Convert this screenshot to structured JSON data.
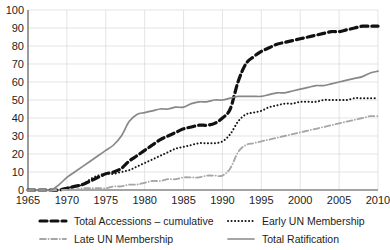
{
  "chart_data": {
    "type": "line",
    "title": "",
    "subtitle": "",
    "xlabel": "",
    "ylabel": "",
    "xlim": [
      1965,
      2010
    ],
    "ylim": [
      0,
      100
    ],
    "xticks": [
      1965,
      1970,
      1975,
      1980,
      1985,
      1990,
      1995,
      2000,
      2005,
      2010
    ],
    "yticks": [
      0,
      10,
      20,
      30,
      40,
      50,
      60,
      70,
      80,
      90,
      100
    ],
    "grid": true,
    "legend_position": "bottom",
    "x": [
      1965,
      1966,
      1967,
      1968,
      1969,
      1970,
      1971,
      1972,
      1973,
      1974,
      1975,
      1976,
      1977,
      1978,
      1979,
      1980,
      1981,
      1982,
      1983,
      1984,
      1985,
      1986,
      1987,
      1988,
      1989,
      1990,
      1991,
      1992,
      1993,
      1994,
      1995,
      1996,
      1997,
      1998,
      1999,
      2000,
      2001,
      2002,
      2003,
      2004,
      2005,
      2006,
      2007,
      2008,
      2009,
      2010
    ],
    "series": [
      {
        "name": "Total Accessions – cumulative",
        "color": "#111111",
        "style": "dashed",
        "width": 3.2,
        "values": [
          0,
          0,
          0,
          0,
          0,
          1,
          2,
          3,
          5,
          7,
          9,
          10,
          12,
          16,
          19,
          22,
          25,
          28,
          30,
          32,
          34,
          35,
          36,
          36,
          37,
          40,
          45,
          60,
          70,
          74,
          77,
          79,
          81,
          82,
          83,
          84,
          85,
          86,
          87,
          88,
          88,
          89,
          90,
          91,
          91,
          91
        ]
      },
      {
        "name": "Early UN Membership",
        "color": "#141414",
        "style": "dotted",
        "width": 2.0,
        "values": [
          0,
          0,
          0,
          0,
          0,
          1,
          2,
          3,
          6,
          8,
          9,
          9,
          10,
          11,
          13,
          15,
          17,
          19,
          21,
          23,
          24,
          25,
          26,
          26,
          26,
          27,
          31,
          38,
          42,
          43,
          44,
          46,
          47,
          48,
          48,
          49,
          49,
          49,
          50,
          50,
          50,
          50,
          51,
          51,
          51,
          51
        ]
      },
      {
        "name": "Late UN Membership",
        "color": "#a6a6a6",
        "style": "dashdot",
        "width": 1.8,
        "values": [
          0,
          0,
          0,
          0,
          0,
          0,
          0,
          1,
          1,
          1,
          1,
          2,
          2,
          3,
          3,
          4,
          5,
          5,
          6,
          6,
          7,
          7,
          7,
          8,
          8,
          8,
          12,
          21,
          25,
          26,
          27,
          28,
          29,
          30,
          31,
          32,
          33,
          34,
          35,
          36,
          37,
          38,
          39,
          40,
          41,
          41
        ]
      },
      {
        "name": "Total Ratification",
        "color": "#888888",
        "style": "solid",
        "width": 1.7,
        "values": [
          0,
          0,
          0,
          0,
          3,
          7,
          10,
          13,
          16,
          19,
          22,
          25,
          30,
          38,
          42,
          43,
          44,
          45,
          45,
          46,
          46,
          48,
          49,
          49,
          50,
          50,
          51,
          52,
          52,
          52,
          52,
          53,
          54,
          54,
          55,
          56,
          57,
          58,
          58,
          59,
          60,
          61,
          62,
          63,
          65,
          66
        ]
      }
    ]
  },
  "legend": {
    "items": [
      {
        "label": "Total Accessions – cumulative"
      },
      {
        "label": "Early UN Membership"
      },
      {
        "label": "Late UN Membership"
      },
      {
        "label": "Total Ratification"
      }
    ]
  }
}
